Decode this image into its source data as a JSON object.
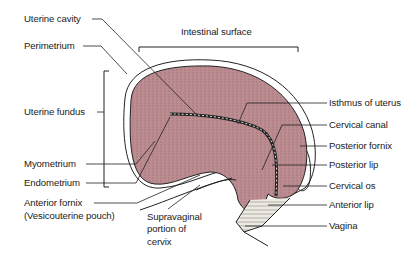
{
  "colors": {
    "myometrium": "#b98a8e",
    "myometrium_lines": "#7a4a52",
    "outline": "#222222",
    "cervix_fill": "#e8e4dc",
    "background": "#ffffff"
  },
  "labels": {
    "uterine_cavity": "Uterine cavity",
    "perimetrium": "Perimetrium",
    "intestinal_surface": "Intestinal surface",
    "uterine_fundus": "Uterine fundus",
    "myometrium": "Myometrium",
    "endometrium": "Endometrium",
    "anterior_fornix": "Anterior fornix",
    "vesicouterine_pouch": "(Vesicouterine pouch)",
    "supravaginal_1": "Supravaginal",
    "supravaginal_2": "portion of",
    "supravaginal_3": "cervix",
    "isthmus": "Isthmus of uterus",
    "cervical_canal": "Cervical canal",
    "posterior_fornix": "Posterior fornix",
    "posterior_lip": "Posterior lip",
    "cervical_os": "Cervical os",
    "anterior_lip": "Anterior lip",
    "vagina": "Vagina"
  }
}
